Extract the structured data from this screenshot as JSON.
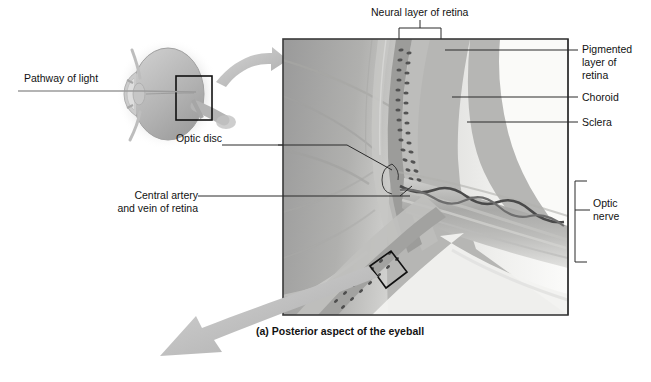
{
  "figure": {
    "caption": "(a) Posterior aspect of the eyeball",
    "panel_title_part": "(a)",
    "type": "anatomical-illustration"
  },
  "labels": {
    "pathway_of_light": "Pathway of light",
    "neural_layer": "Neural layer of retina",
    "pigmented_layer": "Pigmented\nlayer of\nretina",
    "pigmented_layer_l1": "Pigmented",
    "pigmented_layer_l2": "layer of",
    "pigmented_layer_l3": "retina",
    "choroid": "Choroid",
    "sclera": "Sclera",
    "optic_disc": "Optic disc",
    "central_artery_l1": "Central artery",
    "central_artery_l2": "and vein of retina",
    "optic_nerve_l1": "Optic",
    "optic_nerve_l2": "nerve"
  },
  "icons": {
    "zoom_arrow": "curved-arrow-icon",
    "magnify_arrow": "curved-arrow-icon",
    "inset_box": "inset-rectangle-icon",
    "tilted_box": "tilted-rectangle-icon"
  },
  "colors": {
    "background": "#ffffff",
    "label_text": "#121212",
    "leader_line": "#2b2b2b",
    "panel_border": "#3a3a3a",
    "arrow_gray": "#b9b9b9",
    "eye_gray": "#b5b5b5",
    "micrograph_dark": "#8a8a8a",
    "micrograph_light": "#e8e8e6"
  },
  "geometry": {
    "panel": {
      "x": 283,
      "y": 39,
      "w": 285,
      "h": 276
    },
    "eye": {
      "cx": 166,
      "cy": 94,
      "rx": 36,
      "ry": 46
    },
    "inset_box": {
      "x": 176,
      "y": 76,
      "w": 36,
      "h": 44
    }
  }
}
